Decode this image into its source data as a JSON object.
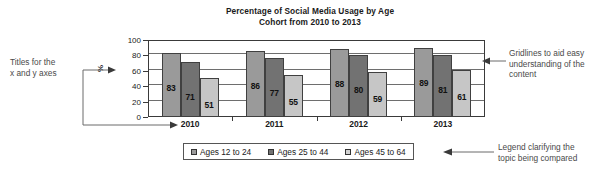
{
  "chart_data": {
    "type": "bar",
    "title": "Percentage of Social Media Usage by Age Cohort from 2010 to 2013",
    "title_line1": "Percentage of Social Media Usage by Age",
    "title_line2": "Cohort from 2010 to 2013",
    "categories": [
      "2010",
      "2011",
      "2012",
      "2013"
    ],
    "series": [
      {
        "name": "Ages 12 to 24",
        "values": [
          83,
          86,
          88,
          89
        ],
        "color": "#9a9a9a"
      },
      {
        "name": "Ages 25 to 44",
        "values": [
          71,
          77,
          80,
          81
        ],
        "color": "#727272"
      },
      {
        "name": "Ages 45 to 64",
        "values": [
          51,
          55,
          59,
          61
        ],
        "color": "#c6c6c6"
      }
    ],
    "xlabel": "",
    "ylabel": "%",
    "ylim": [
      0,
      100
    ],
    "yticks": [
      0,
      20,
      40,
      60,
      80,
      100
    ],
    "ytick_labels": [
      "0",
      "20",
      "40",
      "60",
      "80",
      "100"
    ],
    "grid": true,
    "grid_axis": "y",
    "legend_position": "bottom",
    "data_labels": true
  },
  "annotations": {
    "axes_titles": "Titles for the\nx and y axes",
    "gridlines": "Gridlines to aid easy\nunderstanding of the\ncontent",
    "legend": "Legend clarifying the\ntopic being compared"
  },
  "icons": {
    "arrow_right": "arrow-right-icon",
    "arrow_left": "arrow-left-icon"
  }
}
